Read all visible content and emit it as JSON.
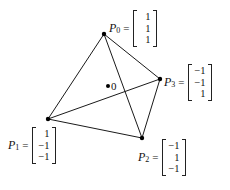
{
  "diagram": {
    "origin": {
      "label": "0",
      "x": 108,
      "y": 86
    },
    "vertices": [
      {
        "name": "P",
        "index": "0",
        "x": 104,
        "y": 34,
        "vector": [
          "1",
          "1",
          "1"
        ]
      },
      {
        "name": "P",
        "index": "1",
        "x": 48,
        "y": 119,
        "vector": [
          "1",
          "−1",
          "−1"
        ]
      },
      {
        "name": "P",
        "index": "2",
        "x": 142,
        "y": 138,
        "vector": [
          "−1",
          "1",
          "−1"
        ]
      },
      {
        "name": "P",
        "index": "3",
        "x": 160,
        "y": 79,
        "vector": [
          "−1",
          "−1",
          "1"
        ]
      }
    ],
    "edges": [
      [
        "P0",
        "P1"
      ],
      [
        "P0",
        "P2"
      ],
      [
        "P0",
        "P3"
      ],
      [
        "P1",
        "P2"
      ],
      [
        "P1",
        "P3"
      ],
      [
        "P2",
        "P3"
      ]
    ],
    "equals_sign": "="
  }
}
